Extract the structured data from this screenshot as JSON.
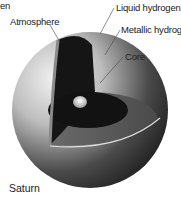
{
  "diagram": {
    "caption": "Saturn",
    "clipped_label": "en",
    "labels": {
      "atmosphere": "Atmosphere",
      "liquid_hydrogen": "Liquid hydrogen",
      "metallic_hydrogen": "Metallic hydrogen",
      "core": "Core"
    },
    "colors": {
      "outer_shell_light": "#e6e6e6",
      "outer_shell_dark": "#2a2a2a",
      "liquid_layer": "#5a5a5a",
      "metallic_layer": "#111111",
      "core": "#d8d8d8",
      "label_text": "#222222"
    }
  }
}
